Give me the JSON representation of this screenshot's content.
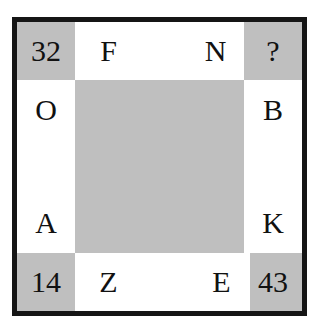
{
  "puzzle": {
    "type": "letter-number-border-grid",
    "border_color": "#151515",
    "cell_gray": "#bfbfbf",
    "cell_white": "#ffffff",
    "text_color": "#111111",
    "corners": {
      "top_left": "32",
      "top_right": "?",
      "bottom_left": "14",
      "bottom_right": "43"
    },
    "top_edge": [
      "F",
      "N"
    ],
    "bottom_edge": [
      "Z",
      "E"
    ],
    "left_edge": [
      "O",
      "A"
    ],
    "right_edge": [
      "B",
      "K"
    ],
    "center": ""
  }
}
